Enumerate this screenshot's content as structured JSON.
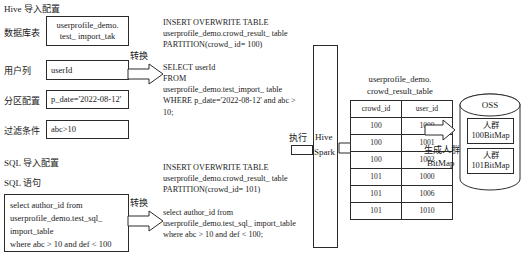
{
  "diagram": {
    "title_hive": "Hive 导入配置",
    "title_sql": "SQL 导入配置",
    "sql_stmt_label": "SQL 语句",
    "hive_fields": [
      {
        "label": "数据库表",
        "value": "userprofile_demo.\ntest_ import_tak"
      },
      {
        "label": "用户列",
        "value": "userId"
      },
      {
        "label": "分区配置",
        "value": "p_date='2022-08-12'"
      },
      {
        "label": "过滤条件",
        "value": "abc>10"
      }
    ],
    "sql_input": "select author_id from\nuserprofile_demo.test_sql_\nimport_table\nwhere abc > 10 and def < 100",
    "convert_label_top": "转换",
    "convert_label_bottom": "转换",
    "generated_sql_top": "INSERT OVERWRITE TABLE\nuserprofile_demo.crowd_result_ table\nPARTITION(crowd_ id= 100)\n\nSELECT userId\nFROM\nuserprofile_demo.test_import_ table\nWHERE p_date='2022-08-12' and abc >\n10;",
    "generated_sql_bottom": "INSERT OVERWRITE TABLE\nuserprofile_demo.crowd_result_ table\nPARTITION(crowd_id= 101)\n\nselect author_id from\nuserprofile_demo.test_sql_ import_table\nwhere abc > 10 and def < 100;",
    "execute_label": "执行",
    "engine_line1": "Hive",
    "engine_line2": "Spark",
    "result_table": {
      "caption_line1": "userprofile_demo.",
      "caption_line2": "crowd_result_table",
      "columns": [
        "crowd_id",
        "user_id"
      ],
      "rows": [
        [
          "100",
          "1000"
        ],
        [
          "100",
          "1001"
        ],
        [
          "100",
          "1002"
        ],
        [
          "101",
          "1000"
        ],
        [
          "101",
          "1006"
        ],
        [
          "101",
          "1010"
        ]
      ]
    },
    "bitmap_label_line1": "生成人群",
    "bitmap_label_line2": "BitMap",
    "oss": {
      "title": "OSS",
      "items": [
        {
          "line1": "人群",
          "line2": "100BitMap"
        },
        {
          "line1": "人群",
          "line2": "101BitMap"
        }
      ]
    }
  },
  "colors": {
    "stroke": "#2b2b2b",
    "text": "#1a1a1a",
    "background": "#ffffff"
  }
}
